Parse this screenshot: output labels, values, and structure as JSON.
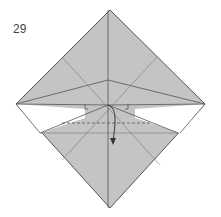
{
  "diagram": {
    "step_number": "29",
    "fill_color": "#c4c4c4",
    "line_color": "#555555"
  }
}
